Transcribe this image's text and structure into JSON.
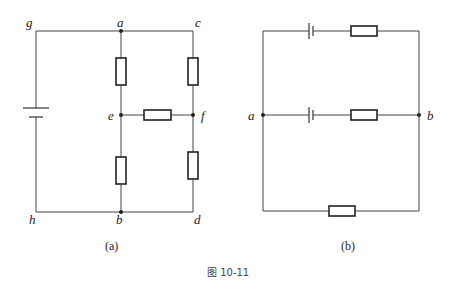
{
  "figure_caption": "图 10-11",
  "circuit_a": {
    "caption": "(a)",
    "nodes": {
      "g": "g",
      "a": "a",
      "c": "c",
      "e": "e",
      "f": "f",
      "h": "h",
      "b": "b",
      "d": "d"
    },
    "components": [
      {
        "type": "battery",
        "between": "g-h"
      },
      {
        "type": "resistor",
        "between": "a-e"
      },
      {
        "type": "resistor",
        "between": "c-f"
      },
      {
        "type": "resistor",
        "between": "e-f"
      },
      {
        "type": "resistor",
        "between": "e-b"
      },
      {
        "type": "resistor",
        "between": "f-d"
      }
    ]
  },
  "circuit_b": {
    "caption": "(b)",
    "nodes": {
      "a": "a",
      "b": "b"
    },
    "components": [
      {
        "type": "battery",
        "branch": "top"
      },
      {
        "type": "resistor",
        "branch": "top"
      },
      {
        "type": "battery",
        "branch": "middle"
      },
      {
        "type": "resistor",
        "branch": "middle"
      },
      {
        "type": "resistor",
        "branch": "bottom"
      }
    ]
  }
}
